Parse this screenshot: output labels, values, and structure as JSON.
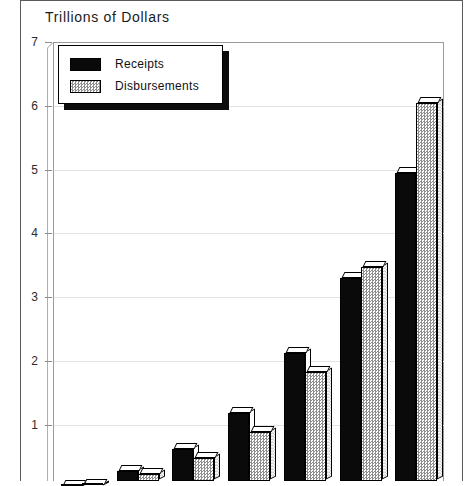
{
  "chart_data": {
    "type": "bar",
    "title": "Trillions of Dollars",
    "xlabel": "",
    "ylabel": "Trillions of Dollars",
    "ylim": [
      0,
      7
    ],
    "yticks": [
      1,
      2,
      3,
      4,
      5,
      6,
      7
    ],
    "ytick_labels": [
      "1",
      "2",
      "3",
      "4",
      "5",
      "6",
      "7"
    ],
    "grid": true,
    "legend_position": "upper-left",
    "categories": [
      "1",
      "2",
      "3",
      "4",
      "5",
      "6",
      "7"
    ],
    "series": [
      {
        "name": "Receipts",
        "color": "#0a0a0a",
        "values": [
          0.03,
          0.28,
          0.62,
          1.18,
          2.13,
          3.3,
          4.95
        ]
      },
      {
        "name": "Disbursements",
        "color": "#8e8e8e",
        "values": [
          0.05,
          0.23,
          0.48,
          0.89,
          1.82,
          3.47,
          6.04
        ]
      }
    ]
  },
  "figure": {
    "title": "Trillions of Dollars",
    "axis": {
      "y_tick_labels": [
        "7",
        "6",
        "5",
        "4",
        "3",
        "2",
        "1"
      ]
    },
    "legend": {
      "items": [
        {
          "label": "Receipts",
          "swatch": "solid-black-swatch"
        },
        {
          "label": "Disbursements",
          "swatch": "hatched-gray-swatch"
        }
      ]
    }
  }
}
